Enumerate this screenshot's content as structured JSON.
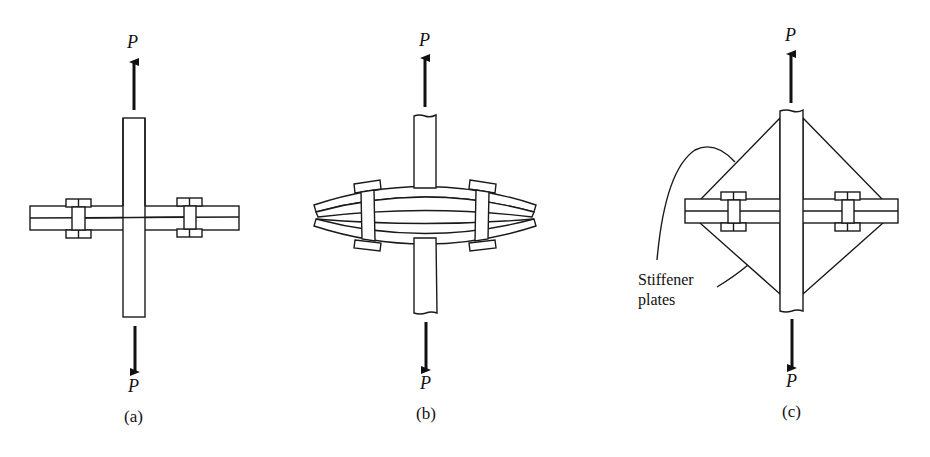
{
  "figure": {
    "panels": [
      {
        "id": "a",
        "caption": "(a)",
        "load_top": "P",
        "load_bottom": "P"
      },
      {
        "id": "b",
        "caption": "(b)",
        "load_top": "P",
        "load_bottom": "P"
      },
      {
        "id": "c",
        "caption": "(c)",
        "load_top": "P",
        "load_bottom": "P",
        "annotation_line1": "Stiffener",
        "annotation_line2": "plates"
      }
    ]
  }
}
